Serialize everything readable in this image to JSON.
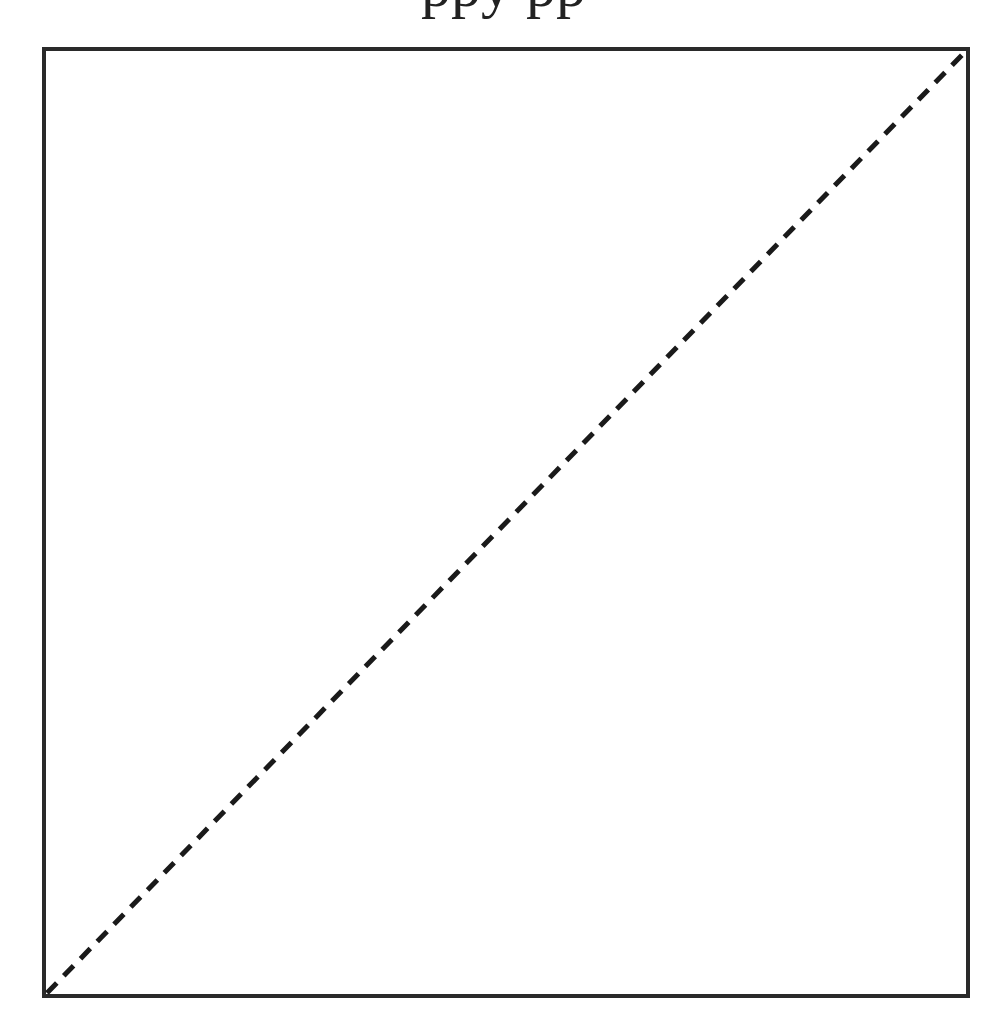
{
  "chart_data": {
    "type": "line",
    "title_visible_fragment": "ppy pp",
    "xlabel": "",
    "ylabel": "",
    "xlim": [
      0,
      1
    ],
    "ylim": [
      0,
      1
    ],
    "grid": false,
    "legend": null,
    "series": [
      {
        "name": "reference-diagonal",
        "style": "dashed",
        "color": "#1a1a1a",
        "x": [
          0,
          1
        ],
        "y": [
          0,
          1
        ]
      }
    ]
  },
  "colors": {
    "frame": "#2a2a2a",
    "line": "#1a1a1a",
    "background": "#ffffff"
  }
}
